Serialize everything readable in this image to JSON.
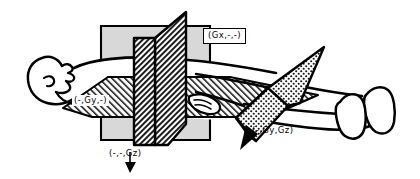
{
  "figure": {
    "view": "lateral oblique line drawing, head at left, feet at right",
    "background_color": "#ffffff",
    "line_color": "#000000",
    "panel_fill_color": "#d8d8d8",
    "hatch_color": "#000000"
  },
  "labels": {
    "gx": "(Gx,-,-)",
    "gy": "(-,Gy,-)",
    "gz": "(-,-,Gz)",
    "gy_gz": "(-,Gy,Gz)"
  },
  "planes": [
    {
      "name": "sagittal-plane",
      "label": "(Gx,-,-)",
      "gradient": "Gx",
      "orientation": "vertical sagittal slab",
      "fill": "diagonal-hatch",
      "label_style": "boxed"
    },
    {
      "name": "coronal-plane",
      "label": "(-,-,Gz)",
      "gradient": "Gz",
      "orientation": "vertical coronal panel",
      "fill": "solid-gray",
      "label_style": "plain",
      "has_arrow": true,
      "arrow_direction": "down"
    },
    {
      "name": "axial-plane",
      "label": "(-,Gy,-)",
      "gradient": "Gy",
      "orientation": "horizontal axial slab",
      "fill": "diagonal-hatch",
      "label_style": "on-hatch"
    },
    {
      "name": "oblique-plane",
      "label": "(-,Gy,Gz)",
      "gradient": "Gy and Gz combined",
      "orientation": "oblique double-gradient plane across the legs",
      "fill": "stipple-dot",
      "label_style": "plain",
      "has_arrow": true,
      "arrow_direction": "down-left"
    }
  ],
  "body_parts": [
    {
      "name": "head-profile",
      "position": "far left"
    },
    {
      "name": "torso",
      "position": "center left"
    },
    {
      "name": "arm-and-hand",
      "position": "center right"
    },
    {
      "name": "legs",
      "position": "right"
    },
    {
      "name": "feet",
      "position": "far right"
    }
  ]
}
